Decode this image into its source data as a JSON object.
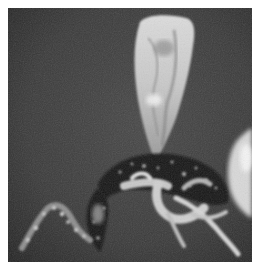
{
  "image": {
    "kind": "grayscale photograph",
    "subject": "insect specimen with translucent wing on dark background",
    "colors": {
      "background": "#3a3a3a",
      "background_dark": "#262626",
      "border": "#ffffff",
      "wing_light": "#e8e8e8",
      "body_dark": "#141414",
      "legs_light": "#d4d4d4"
    }
  }
}
